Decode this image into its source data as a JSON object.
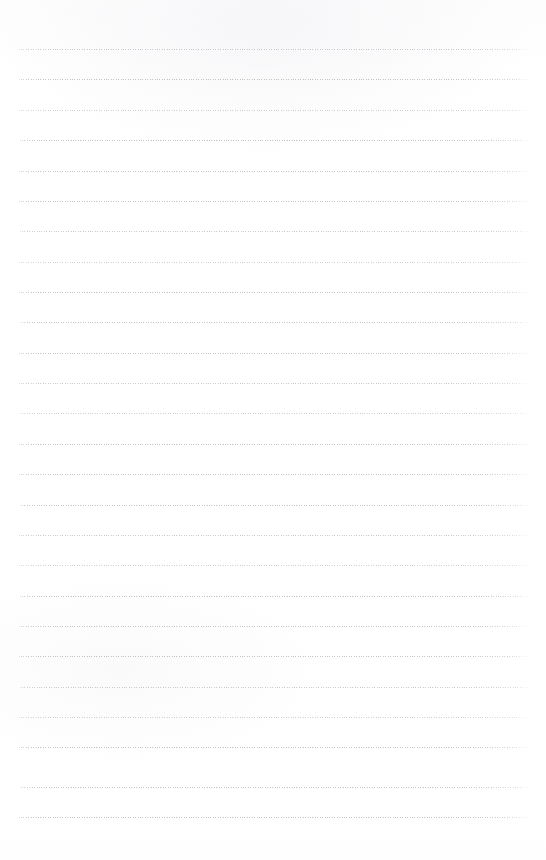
{
  "document": {
    "kind": "blank-ruled-notebook-page",
    "title": "",
    "heading": "",
    "body_text": "",
    "visible_text": "",
    "page_number": "",
    "handwriting": ""
  },
  "canvas": {
    "width": 546,
    "height": 860,
    "background_color": "#ffffff"
  },
  "ruling": {
    "line_color": "#9294a0",
    "line_style": "dotted",
    "line_count": 26,
    "first_line_y": 49,
    "line_spacing": 30.4,
    "left_x": 16,
    "right_x": 530,
    "lines": [
      {
        "y": 49,
        "left": 16,
        "right": 530,
        "density": 0
      },
      {
        "y": 79,
        "left": 16,
        "right": 531,
        "density": 1
      },
      {
        "y": 110,
        "left": 16,
        "right": 530,
        "density": 2
      },
      {
        "y": 140,
        "left": 17,
        "right": 529,
        "density": 1
      },
      {
        "y": 171,
        "left": 16,
        "right": 530,
        "density": 3
      },
      {
        "y": 201,
        "left": 16,
        "right": 531,
        "density": 1
      },
      {
        "y": 231,
        "left": 17,
        "right": 530,
        "density": 0
      },
      {
        "y": 262,
        "left": 16,
        "right": 529,
        "density": 2
      },
      {
        "y": 292,
        "left": 16,
        "right": 530,
        "density": 1
      },
      {
        "y": 322,
        "left": 17,
        "right": 531,
        "density": 3
      },
      {
        "y": 353,
        "left": 16,
        "right": 530,
        "density": 1
      },
      {
        "y": 383,
        "left": 16,
        "right": 529,
        "density": 0
      },
      {
        "y": 413,
        "left": 17,
        "right": 530,
        "density": 2
      },
      {
        "y": 444,
        "left": 16,
        "right": 531,
        "density": 1
      },
      {
        "y": 474,
        "left": 16,
        "right": 530,
        "density": 3
      },
      {
        "y": 505,
        "left": 17,
        "right": 529,
        "density": 1
      },
      {
        "y": 535,
        "left": 16,
        "right": 530,
        "density": 0
      },
      {
        "y": 565,
        "left": 16,
        "right": 531,
        "density": 2
      },
      {
        "y": 596,
        "left": 17,
        "right": 530,
        "density": 1
      },
      {
        "y": 626,
        "left": 16,
        "right": 529,
        "density": 3
      },
      {
        "y": 656,
        "left": 16,
        "right": 530,
        "density": 1
      },
      {
        "y": 687,
        "left": 17,
        "right": 531,
        "density": 0
      },
      {
        "y": 717,
        "left": 16,
        "right": 530,
        "density": 2
      },
      {
        "y": 747,
        "left": 16,
        "right": 529,
        "density": 1
      },
      {
        "y": 787,
        "left": 17,
        "right": 530,
        "density": 3
      },
      {
        "y": 817,
        "left": 16,
        "right": 530,
        "density": 1
      }
    ]
  },
  "margins": {
    "top_blank_height": 49,
    "bottom_blank_height": 43
  }
}
